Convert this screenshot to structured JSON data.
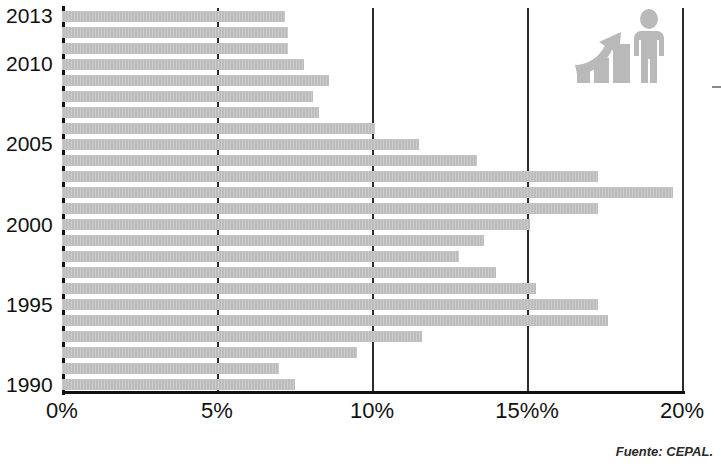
{
  "chart_data": {
    "type": "bar",
    "orientation": "horizontal",
    "title": "",
    "subtitle": "",
    "xlabel": "",
    "ylabel": "",
    "xlim": [
      0,
      20
    ],
    "ylim": [
      1990,
      2013
    ],
    "grid": true,
    "legend": null,
    "bar_color": "#bdbdbd",
    "axis_color": "#111111",
    "categories": [
      "2013",
      "2012",
      "2011",
      "2010",
      "2009",
      "2008",
      "2007",
      "2006",
      "2005",
      "2004",
      "2003",
      "2002",
      "2001",
      "2000",
      "1999",
      "1998",
      "1997",
      "1996",
      "1995",
      "1994",
      "1993",
      "1992",
      "1991",
      "1990"
    ],
    "values": [
      7.2,
      7.3,
      7.3,
      7.8,
      8.6,
      8.1,
      8.3,
      10.1,
      11.5,
      13.4,
      17.3,
      19.7,
      17.3,
      15.1,
      13.6,
      12.8,
      14.0,
      15.3,
      17.3,
      17.6,
      11.6,
      9.5,
      7.0,
      7.5
    ],
    "value_unit": "%",
    "x_ticks": [
      0,
      5,
      10,
      15,
      20
    ],
    "x_tick_labels": [
      "0%",
      "5%",
      "10%",
      "15%%",
      "20%"
    ],
    "y_tick_labels": [
      "2013",
      "2010",
      "2005",
      "2000",
      "1995",
      "1990"
    ],
    "y_ticks_years": [
      2013,
      2010,
      2005,
      2000,
      1995,
      1990
    ]
  },
  "annotations": {
    "source": "Fuente: CEPAL."
  },
  "icons": {
    "growth_icon": "growth-bars-person-icon"
  }
}
